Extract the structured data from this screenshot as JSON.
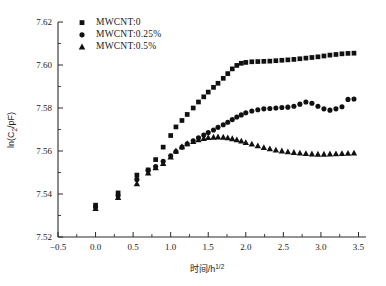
{
  "chart_data": {
    "type": "scatter",
    "title": "",
    "xlabel": "时间/h",
    "xlabel_sup": "1/2",
    "ylabel_prefix": "ln(",
    "ylabel_sub": "2",
    "ylabel_main": "C",
    "ylabel_suffix": "/pF)",
    "ylabel": "ln(C2/pF)",
    "xlim": [
      -0.5,
      3.6
    ],
    "ylim": [
      7.52,
      7.62
    ],
    "xticks": [
      -0.5,
      0.0,
      0.5,
      1.0,
      1.5,
      2.0,
      2.5,
      3.0,
      3.5
    ],
    "xticklabels": [
      "−0.5",
      "0.0",
      "0.5",
      "1.0",
      "1.5",
      "2.0",
      "2.5",
      "3.0",
      "3.5"
    ],
    "yticks": [
      7.52,
      7.54,
      7.56,
      7.58,
      7.6,
      7.62
    ],
    "yticklabels": [
      "7.52",
      "7.54",
      "7.56",
      "7.58",
      "7.60",
      "7.62"
    ],
    "x_minor_step": 0.1,
    "y_minor_step": 0.01,
    "grid": false,
    "legend_position": "top-left",
    "marker_color": "#111111",
    "series": [
      {
        "name": "MWCNT:0",
        "marker": "square",
        "points": [
          [
            0.0,
            7.5348
          ],
          [
            0.3,
            7.5405
          ],
          [
            0.55,
            7.5488
          ],
          [
            0.7,
            7.5512
          ],
          [
            0.8,
            7.556
          ],
          [
            0.9,
            7.5618
          ],
          [
            1.0,
            7.5672
          ],
          [
            1.07,
            7.5712
          ],
          [
            1.15,
            7.5742
          ],
          [
            1.22,
            7.577
          ],
          [
            1.3,
            7.58
          ],
          [
            1.37,
            7.5828
          ],
          [
            1.44,
            7.5852
          ],
          [
            1.5,
            7.5874
          ],
          [
            1.57,
            7.5896
          ],
          [
            1.63,
            7.5915
          ],
          [
            1.7,
            7.5938
          ],
          [
            1.76,
            7.596
          ],
          [
            1.82,
            7.5982
          ],
          [
            1.88,
            7.5998
          ],
          [
            1.94,
            7.6008
          ],
          [
            2.0,
            7.6012
          ],
          [
            2.08,
            7.6015
          ],
          [
            2.16,
            7.6016
          ],
          [
            2.24,
            7.6017
          ],
          [
            2.32,
            7.6018
          ],
          [
            2.4,
            7.602
          ],
          [
            2.48,
            7.6022
          ],
          [
            2.56,
            7.6024
          ],
          [
            2.64,
            7.6026
          ],
          [
            2.72,
            7.6029
          ],
          [
            2.8,
            7.6032
          ],
          [
            2.88,
            7.6035
          ],
          [
            2.96,
            7.6038
          ],
          [
            3.04,
            7.6042
          ],
          [
            3.12,
            7.6046
          ],
          [
            3.2,
            7.6049
          ],
          [
            3.28,
            7.6052
          ],
          [
            3.36,
            7.6054
          ],
          [
            3.44,
            7.6055
          ]
        ]
      },
      {
        "name": "MWCNT:0.25%",
        "marker": "circle",
        "points": [
          [
            0.0,
            7.534
          ],
          [
            0.3,
            7.5392
          ],
          [
            0.55,
            7.5468
          ],
          [
            0.7,
            7.551
          ],
          [
            0.8,
            7.5528
          ],
          [
            0.9,
            7.5552
          ],
          [
            1.0,
            7.5578
          ],
          [
            1.07,
            7.5598
          ],
          [
            1.15,
            7.5618
          ],
          [
            1.22,
            7.5634
          ],
          [
            1.3,
            7.5648
          ],
          [
            1.37,
            7.5662
          ],
          [
            1.44,
            7.5674
          ],
          [
            1.5,
            7.5686
          ],
          [
            1.57,
            7.5698
          ],
          [
            1.63,
            7.571
          ],
          [
            1.7,
            7.5722
          ],
          [
            1.76,
            7.5734
          ],
          [
            1.82,
            7.5746
          ],
          [
            1.88,
            7.5758
          ],
          [
            1.94,
            7.5768
          ],
          [
            2.0,
            7.5778
          ],
          [
            2.08,
            7.5786
          ],
          [
            2.16,
            7.5792
          ],
          [
            2.24,
            7.5796
          ],
          [
            2.32,
            7.5798
          ],
          [
            2.4,
            7.58
          ],
          [
            2.48,
            7.5802
          ],
          [
            2.56,
            7.5804
          ],
          [
            2.64,
            7.5808
          ],
          [
            2.72,
            7.5818
          ],
          [
            2.8,
            7.5828
          ],
          [
            2.88,
            7.5822
          ],
          [
            2.96,
            7.5808
          ],
          [
            3.04,
            7.5796
          ],
          [
            3.12,
            7.579
          ],
          [
            3.2,
            7.5796
          ],
          [
            3.28,
            7.5806
          ],
          [
            3.36,
            7.584
          ],
          [
            3.44,
            7.5842
          ]
        ]
      },
      {
        "name": "MWCNT:0.5%",
        "marker": "triangle",
        "points": [
          [
            0.0,
            7.5332
          ],
          [
            0.3,
            7.5384
          ],
          [
            0.55,
            7.5448
          ],
          [
            0.7,
            7.5498
          ],
          [
            0.8,
            7.5522
          ],
          [
            0.9,
            7.5542
          ],
          [
            1.0,
            7.5572
          ],
          [
            1.07,
            7.56
          ],
          [
            1.15,
            7.562
          ],
          [
            1.22,
            7.5634
          ],
          [
            1.3,
            7.5644
          ],
          [
            1.37,
            7.5652
          ],
          [
            1.44,
            7.5658
          ],
          [
            1.5,
            7.5662
          ],
          [
            1.57,
            7.5664
          ],
          [
            1.63,
            7.5665
          ],
          [
            1.7,
            7.5664
          ],
          [
            1.76,
            7.5661
          ],
          [
            1.82,
            7.5657
          ],
          [
            1.88,
            7.5652
          ],
          [
            1.94,
            7.5646
          ],
          [
            2.0,
            7.5639
          ],
          [
            2.08,
            7.5632
          ],
          [
            2.16,
            7.5624
          ],
          [
            2.24,
            7.5616
          ],
          [
            2.32,
            7.561
          ],
          [
            2.4,
            7.5604
          ],
          [
            2.48,
            7.56
          ],
          [
            2.56,
            7.5596
          ],
          [
            2.64,
            7.5593
          ],
          [
            2.72,
            7.559
          ],
          [
            2.8,
            7.5588
          ],
          [
            2.88,
            7.5586
          ],
          [
            2.96,
            7.5585
          ],
          [
            3.04,
            7.5585
          ],
          [
            3.12,
            7.5586
          ],
          [
            3.2,
            7.5587
          ],
          [
            3.28,
            7.5588
          ],
          [
            3.36,
            7.5589
          ],
          [
            3.44,
            7.559
          ]
        ]
      }
    ],
    "legend": [
      {
        "label": "MWCNT:0",
        "marker": "square"
      },
      {
        "label": "MWCNT:0.25%",
        "marker": "circle"
      },
      {
        "label": "MWCNT:0.5%",
        "marker": "triangle"
      }
    ]
  }
}
